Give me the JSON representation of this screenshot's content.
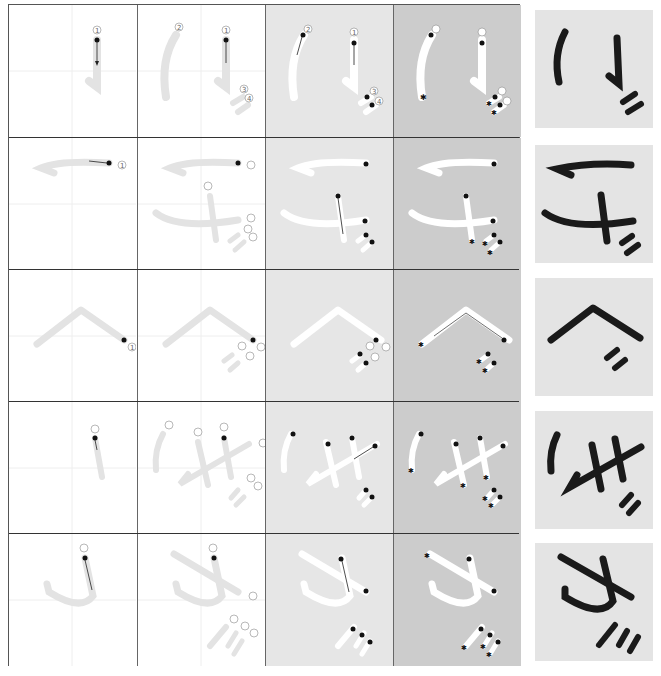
{
  "columns": [
    "first-stroke",
    "all-strokes-outline",
    "direction-guide",
    "end-marked-guide",
    "finished-character"
  ],
  "colors": {
    "grid_line": "#555555",
    "guide_line": "#e0e0e0",
    "ghost_stroke": "#e3e3e3",
    "col3_bg": "#e6e6e6",
    "col4_bg": "#cccccc",
    "final_bg": "#e4e4e4",
    "ink": "#1a1a1a",
    "white_stroke": "#ffffff"
  },
  "characters": [
    {
      "char": "ぐ-like (り with dakuten)",
      "stroke_count": 4,
      "stroke_labels": [
        "1",
        "2",
        "3",
        "4"
      ]
    },
    {
      "char": "げ-like",
      "stroke_count": 5,
      "stroke_labels": [
        "1",
        "2",
        "3",
        "4",
        "5"
      ]
    },
    {
      "char": "べ",
      "stroke_count": 3,
      "stroke_labels": [
        "1",
        "2",
        "3"
      ]
    },
    {
      "char": "ぎ-like",
      "stroke_count": 6,
      "stroke_labels": [
        "1",
        "2",
        "3",
        "4",
        "5",
        "6"
      ]
    },
    {
      "char": "が-like",
      "stroke_count": 5,
      "stroke_labels": [
        "1",
        "2",
        "3",
        "4",
        "5"
      ]
    }
  ],
  "legend": {
    "start_marker": "black-dot",
    "direction_marker": "arrow",
    "end_marker": "star"
  }
}
